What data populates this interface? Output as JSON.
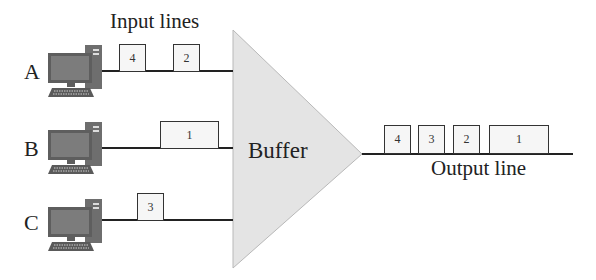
{
  "title": "Input lines",
  "buffer": {
    "label": "Buffer",
    "fill": "#e4e4e4",
    "stroke": "#b5b5b5"
  },
  "output": {
    "label": "Output line",
    "packets": [
      {
        "id": "4"
      },
      {
        "id": "3"
      },
      {
        "id": "2"
      },
      {
        "id": "1"
      }
    ]
  },
  "inputs": [
    {
      "label": "A",
      "packets": [
        {
          "id": "4"
        },
        {
          "id": "2"
        }
      ]
    },
    {
      "label": "B",
      "packets": [
        {
          "id": "1"
        }
      ]
    },
    {
      "label": "C",
      "packets": [
        {
          "id": "3"
        }
      ]
    }
  ],
  "colors": {
    "line": "#222222",
    "computer_body": "#6b6b6b",
    "computer_screen": "#7a7a7a",
    "packet_fill": "#f6f6f6"
  }
}
